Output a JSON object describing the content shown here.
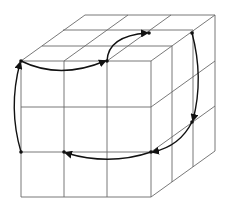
{
  "diagram": {
    "type": "rubiks-cube-cycle",
    "colors": {
      "grid": "#6a6a6a",
      "arrow": "#111111",
      "background": "#ffffff"
    },
    "front_face": {
      "x": [
        21,
        64,
        107,
        151
      ],
      "y": [
        61,
        107,
        152,
        197
      ]
    },
    "depth_step": [
      21,
      -15.3
    ],
    "points": [
      {
        "id": "p1",
        "x": 21,
        "y": 61
      },
      {
        "id": "p2",
        "x": 107,
        "y": 61
      },
      {
        "id": "p3",
        "x": 149,
        "y": 33
      },
      {
        "id": "p4",
        "x": 192,
        "y": 33
      },
      {
        "id": "p5",
        "x": 192,
        "y": 122
      },
      {
        "id": "p6",
        "x": 151,
        "y": 152
      },
      {
        "id": "p7",
        "x": 64,
        "y": 152
      },
      {
        "id": "p8",
        "x": 21,
        "y": 152
      }
    ],
    "arrows": [
      {
        "from": "p1",
        "to": "p2"
      },
      {
        "from": "p2",
        "to": "p3"
      },
      {
        "from": "p4",
        "to": "p5"
      },
      {
        "from": "p5",
        "to": "p6"
      },
      {
        "from": "p6",
        "to": "p7"
      },
      {
        "from": "p8",
        "to": "p1"
      }
    ]
  }
}
